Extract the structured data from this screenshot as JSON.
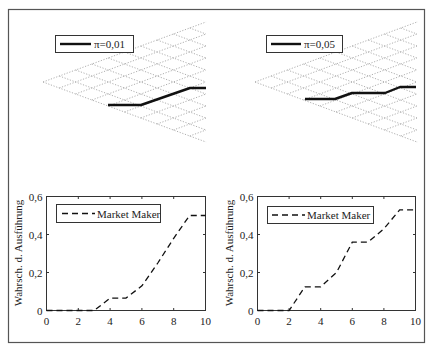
{
  "figure": {
    "border_color": "#555555",
    "line_color": "#111111",
    "grid_color": "#9a9a9a"
  },
  "panels": {
    "top_left": {
      "legend": {
        "label": "π=0,01",
        "line_style": "solid"
      },
      "lattice": {
        "steps": 10
      },
      "path_px": [
        [
          108,
          105
        ],
        [
          141,
          105
        ],
        [
          190,
          88
        ],
        [
          206,
          88
        ]
      ]
    },
    "top_right": {
      "legend": {
        "label": "π=0,05",
        "line_style": "solid"
      },
      "lattice": {
        "steps": 10
      },
      "path_px": [
        [
          305,
          99
        ],
        [
          335,
          99
        ],
        [
          352,
          93
        ],
        [
          385,
          93
        ],
        [
          400,
          87
        ],
        [
          416,
          87
        ]
      ]
    },
    "bottom_left": {
      "ylabel": "Wahrsch. d. Ausführung",
      "legend": {
        "label": "Market Maker",
        "line_style": "dashed"
      },
      "xticks": [
        "0",
        "2",
        "4",
        "6",
        "8",
        "10"
      ],
      "yticks": [
        "0",
        "0,2",
        "0,4",
        "0,6"
      ]
    },
    "bottom_right": {
      "ylabel": "Wahrsch. d. Ausführung",
      "legend": {
        "label": "Market Maker",
        "line_style": "dashed"
      },
      "xticks": [
        "0",
        "2",
        "4",
        "6",
        "8",
        "10"
      ],
      "yticks": [
        "0",
        "0,2",
        "0,4",
        "0,6"
      ]
    }
  },
  "chart_data": [
    {
      "type": "line",
      "title": "",
      "description": "Binomial lattice (10 steps) with sample price path",
      "legend": [
        "π=0,01"
      ],
      "x": [
        4,
        6,
        9,
        10
      ],
      "series": [
        {
          "name": "π=0,01",
          "values": [
            -4,
            -4,
            -1,
            -1
          ]
        }
      ],
      "grid": true
    },
    {
      "type": "line",
      "title": "",
      "description": "Binomial lattice (10 steps) with sample price path",
      "legend": [
        "π=0,05"
      ],
      "x": [
        3,
        5,
        6,
        8,
        9,
        10
      ],
      "series": [
        {
          "name": "π=0,05",
          "values": [
            -3,
            -3,
            -2,
            -2,
            -1,
            -1
          ]
        }
      ],
      "grid": true
    },
    {
      "type": "line",
      "title": "",
      "xlabel": "",
      "ylabel": "Wahrsch. d. Ausführung",
      "xlim": [
        0,
        10
      ],
      "ylim": [
        0,
        0.6
      ],
      "xticks": [
        0,
        2,
        4,
        6,
        8,
        10
      ],
      "yticks": [
        0,
        0.2,
        0.4,
        0.6
      ],
      "legend": [
        "Market Maker"
      ],
      "legend_position": "upper left",
      "grid": false,
      "x": [
        0,
        1,
        2,
        3,
        4,
        5,
        6,
        7,
        8,
        9,
        10
      ],
      "series": [
        {
          "name": "Market Maker",
          "style": "dashed",
          "values": [
            0,
            0,
            0,
            0,
            0.065,
            0.065,
            0.13,
            0.25,
            0.38,
            0.5,
            0.5
          ]
        }
      ]
    },
    {
      "type": "line",
      "title": "",
      "xlabel": "",
      "ylabel": "Wahrsch. d. Ausführung",
      "xlim": [
        0,
        10
      ],
      "ylim": [
        0,
        0.6
      ],
      "xticks": [
        0,
        2,
        4,
        6,
        8,
        10
      ],
      "yticks": [
        0,
        0.2,
        0.4,
        0.6
      ],
      "legend": [
        "Market Maker"
      ],
      "legend_position": "upper left",
      "grid": false,
      "x": [
        0,
        1,
        2,
        3,
        4,
        5,
        6,
        7,
        8,
        9,
        10
      ],
      "series": [
        {
          "name": "Market Maker",
          "style": "dashed",
          "values": [
            0,
            0,
            0,
            0.125,
            0.125,
            0.2,
            0.36,
            0.36,
            0.43,
            0.53,
            0.53
          ]
        }
      ]
    }
  ]
}
